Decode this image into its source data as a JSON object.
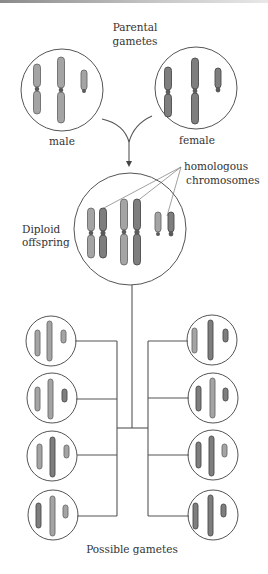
{
  "labels": {
    "parental_line1": "Parental",
    "parental_line2": "gametes",
    "male": "male",
    "female": "female",
    "homologous_line1": "homologous",
    "homologous_line2": "chromosomes",
    "diploid_line1": "Diploid",
    "diploid_line2": "offspring",
    "possible_gametes": "Possible gametes"
  },
  "parents": [
    {
      "name": "male",
      "shade": "light",
      "chromosomes": 3
    },
    {
      "name": "female",
      "shade": "dark",
      "chromosomes": 3
    }
  ],
  "offspring": {
    "name": "diploid",
    "chromosomes": 6,
    "homologous_pairs": 3
  },
  "gametes": {
    "count": 8,
    "left": [
      [
        "light",
        "light",
        "light"
      ],
      [
        "light",
        "light",
        "dark"
      ],
      [
        "light",
        "dark",
        "light"
      ],
      [
        "dark",
        "light",
        "light"
      ]
    ],
    "right": [
      [
        "light",
        "dark",
        "dark"
      ],
      [
        "dark",
        "light",
        "dark"
      ],
      [
        "dark",
        "dark",
        "light"
      ],
      [
        "dark",
        "dark",
        "dark"
      ]
    ]
  },
  "colors": {
    "paternal": "#a4a4a4",
    "maternal": "#7e7e7e",
    "line": "#555555",
    "text": "#333333"
  }
}
